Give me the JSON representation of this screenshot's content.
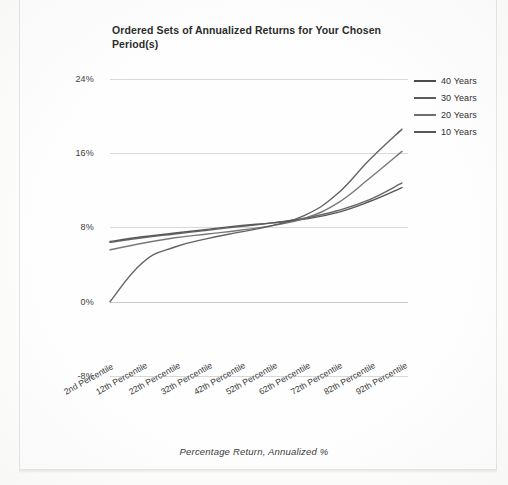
{
  "chart_data": {
    "type": "line",
    "title": "Ordered Sets of Annualized Returns for Your Chosen Period(s)",
    "xlabel": "Percentage Return, Annualized %",
    "ylabel": "",
    "categories": [
      "2nd Percentile",
      "12th Percentile",
      "22th Percentile",
      "32th Percentile",
      "42th Percentile",
      "52th Percentile",
      "62th Percentile",
      "72th Percentile",
      "82th Percentile",
      "92th Percentile"
    ],
    "ylim": [
      -8,
      24
    ],
    "yticks": [
      "-8%",
      "0%",
      "8%",
      "16%",
      "24%"
    ],
    "ytick_values": [
      -8,
      0,
      8,
      16,
      24
    ],
    "grid": true,
    "legend_position": "right",
    "series": [
      {
        "name": "40 Years",
        "color": "#4a4a4a",
        "values": [
          6.5,
          7.0,
          7.4,
          7.8,
          8.2,
          8.5,
          8.9,
          9.6,
          10.8,
          12.3
        ]
      },
      {
        "name": "30 Years",
        "color": "#5a5a5a",
        "values": [
          6.4,
          6.9,
          7.3,
          7.7,
          8.1,
          8.5,
          9.0,
          9.8,
          11.0,
          12.8
        ]
      },
      {
        "name": "20 Years",
        "color": "#6e6e6e",
        "values": [
          5.6,
          6.3,
          6.9,
          7.3,
          7.7,
          8.2,
          9.0,
          10.6,
          13.3,
          16.2
        ]
      },
      {
        "name": "10 Years",
        "color": "#565656",
        "values": [
          0.0,
          4.2,
          5.9,
          6.8,
          7.5,
          8.2,
          9.3,
          11.6,
          15.3,
          18.6
        ]
      }
    ]
  },
  "legend": {
    "items": [
      {
        "label": "40 Years"
      },
      {
        "label": "30 Years"
      },
      {
        "label": "20 Years"
      },
      {
        "label": "10 Years"
      }
    ]
  },
  "colors": {
    "gridline": "#d8d8d6",
    "axis_text": "#3d3d3d",
    "title_text": "#2b2b2b",
    "page_background": "#fefefe"
  }
}
